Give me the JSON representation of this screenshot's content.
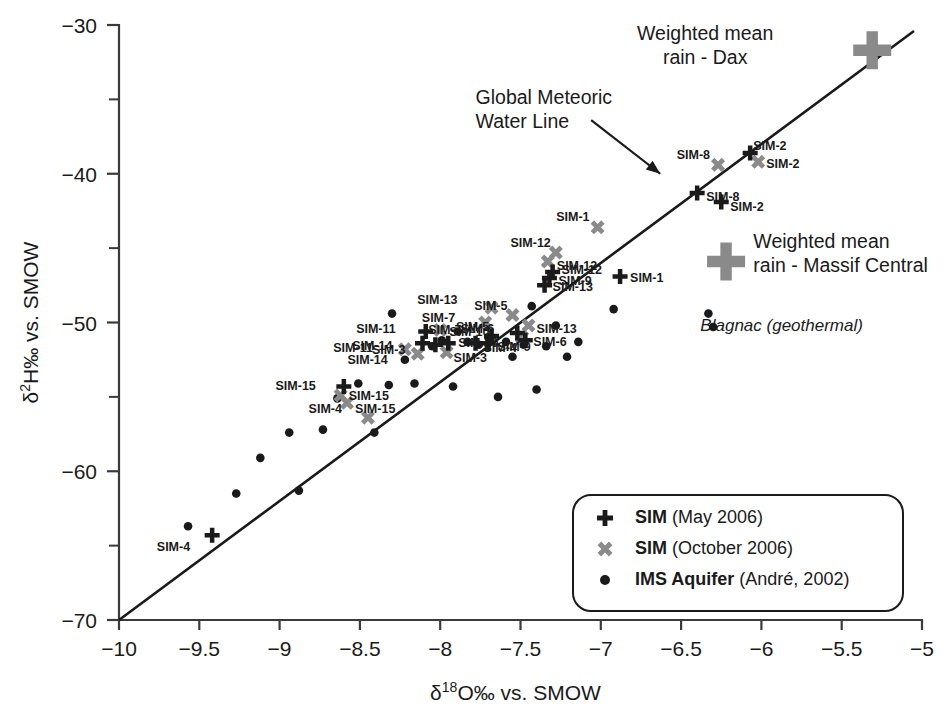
{
  "chart_data": {
    "type": "scatter",
    "title": "",
    "xlabel": "δ¹⁸O‰ vs. SMOW",
    "ylabel": "δ²H‰ vs. SMOW",
    "xlim": [
      -10,
      -5
    ],
    "ylim": [
      -70,
      -30
    ],
    "xticks": [
      "-10",
      "-9.5",
      "-9",
      "-8.5",
      "-8",
      "-7.5",
      "-7",
      "-6.5",
      "-6",
      "-5.5",
      "-5"
    ],
    "xtick_values": [
      -10,
      -9.5,
      -9,
      -8.5,
      -8,
      -7.5,
      -7,
      -6.5,
      -6,
      -5.5,
      -5
    ],
    "yticks": [
      "-30",
      "-40",
      "-50",
      "-60",
      "-70"
    ],
    "ytick_values": [
      -30,
      -40,
      -50,
      -60,
      -70
    ],
    "ytick_minor_values": [
      -35,
      -45,
      -55,
      -65
    ],
    "grid": false,
    "legend_position": "bottom-right",
    "reference_line": {
      "name": "Global Meteoric Water Line",
      "equation_slope": 8,
      "equation_intercept": 10,
      "x_start": -10,
      "y_start": -70,
      "x_end": -5.05,
      "y_end": -30.4,
      "color": "#1a1a1a"
    },
    "series": [
      {
        "name": "SIM (May 2006)",
        "marker": "plus",
        "color": "#1a1a1a",
        "points": [
          {
            "label": "SIM-4",
            "x": -9.42,
            "y": -64.3,
            "lx": -22,
            "ly": 12
          },
          {
            "label": "SIM-15",
            "x": -8.6,
            "y": -54.3,
            "lx": -28,
            "ly": 0
          },
          {
            "label": "SIM-11",
            "x": -8.09,
            "y": -50.6,
            "lx": -30,
            "ly": -2
          },
          {
            "label": "SIM-14",
            "x": -8.11,
            "y": -51.4,
            "lx": -30,
            "ly": 3
          },
          {
            "label": "SIM-3",
            "x": -8.03,
            "y": -51.5,
            "lx": -30,
            "ly": 5
          },
          {
            "label": "SIM-10",
            "x": -7.95,
            "y": -51.4,
            "lx": 10,
            "ly": 0
          },
          {
            "label": "SIM-4",
            "x": -7.78,
            "y": -51.4,
            "lx": 8,
            "ly": 5
          },
          {
            "label": "SIM-9",
            "x": -7.7,
            "y": -51.4,
            "lx": 9,
            "ly": 4
          },
          {
            "label": "SIM-7",
            "x": -7.68,
            "y": -50.9,
            "lx": -30,
            "ly": -6
          },
          {
            "label": "SIM-6",
            "x": -7.47,
            "y": -51.2,
            "lx": 8,
            "ly": 2
          },
          {
            "label": "SIM-5",
            "x": -7.52,
            "y": -50.7,
            "lx": -28,
            "ly": -6
          },
          {
            "label": "SIM-13",
            "x": -7.35,
            "y": -47.5,
            "lx": 8,
            "ly": 2
          },
          {
            "label": "SIM-9",
            "x": -7.32,
            "y": -47.0,
            "lx": 9,
            "ly": 3
          },
          {
            "label": "SIM-12",
            "x": -7.3,
            "y": -46.6,
            "lx": 9,
            "ly": -2
          },
          {
            "label": "SIM-1",
            "x": -6.88,
            "y": -46.9,
            "lx": 10,
            "ly": 2
          },
          {
            "label": "SIM-8",
            "x": -6.4,
            "y": -41.3,
            "lx": 9,
            "ly": 4
          },
          {
            "label": "SIM-2",
            "x": -6.25,
            "y": -41.9,
            "lx": 9,
            "ly": 5
          },
          {
            "label": "SIM-2",
            "x": -6.07,
            "y": -38.6,
            "lx": 3,
            "ly": -7
          }
        ]
      },
      {
        "name": "SIM (October 2006)",
        "marker": "cross",
        "color": "#8a8a8a",
        "points": [
          {
            "label": "SIM-4",
            "x": -8.45,
            "y": -56.4,
            "lx": -26,
            "ly": -9
          },
          {
            "label": "SIM-15",
            "x": -8.62,
            "y": -54.9,
            "lx": 8,
            "ly": 1
          },
          {
            "label": "SIM-15",
            "x": -8.58,
            "y": -55.4,
            "lx": 8,
            "ly": 6
          },
          {
            "label": "SIM-11",
            "x": -8.22,
            "y": -51.8,
            "lx": -32,
            "ly": -1
          },
          {
            "label": "SIM-14",
            "x": -8.14,
            "y": -52.1,
            "lx": -30,
            "ly": 6
          },
          {
            "label": "SIM-3",
            "x": -7.96,
            "y": -52.0,
            "lx": 7,
            "ly": 6
          },
          {
            "label": "SIM-10",
            "x": -8.0,
            "y": -50.5,
            "lx": 9,
            "ly": 2
          },
          {
            "label": "SIM-6",
            "x": -7.49,
            "y": -51.0,
            "lx": -28,
            "ly": -8
          },
          {
            "label": "SIM-7",
            "x": -7.72,
            "y": -50.0,
            "lx": -30,
            "ly": -5
          },
          {
            "label": "SIM-13",
            "x": -7.68,
            "y": -49.0,
            "lx": -34,
            "ly": -8
          },
          {
            "label": "SIM-13",
            "x": -7.45,
            "y": -50.2,
            "lx": 8,
            "ly": 4
          },
          {
            "label": "SIM-5",
            "x": -7.55,
            "y": -49.5,
            "lx": -5,
            "ly": -9
          },
          {
            "label": "SIM-12",
            "x": -7.33,
            "y": -45.9,
            "lx": 9,
            "ly": 4
          },
          {
            "label": "SIM-12",
            "x": -7.28,
            "y": -45.3,
            "lx": -5,
            "ly": -10
          },
          {
            "label": "SIM-1",
            "x": -7.02,
            "y": -43.6,
            "lx": -8,
            "ly": -10
          },
          {
            "label": "SIM-8",
            "x": -6.27,
            "y": -39.4,
            "lx": -8,
            "ly": -10
          },
          {
            "label": "SIM-2",
            "x": -6.02,
            "y": -39.2,
            "lx": 8,
            "ly": 2
          }
        ]
      },
      {
        "name": "IMS Aquifer (André, 2002)",
        "marker": "dot",
        "color": "#1a1a1a",
        "points": [
          {
            "x": -9.57,
            "y": -63.7
          },
          {
            "x": -9.27,
            "y": -61.5
          },
          {
            "x": -9.12,
            "y": -59.1
          },
          {
            "x": -8.94,
            "y": -57.4
          },
          {
            "x": -8.88,
            "y": -61.3
          },
          {
            "x": -8.73,
            "y": -57.2
          },
          {
            "x": -8.64,
            "y": -55.1
          },
          {
            "x": -8.51,
            "y": -54.1
          },
          {
            "x": -8.41,
            "y": -57.4
          },
          {
            "x": -8.32,
            "y": -54.2
          },
          {
            "x": -8.3,
            "y": -49.4
          },
          {
            "x": -8.22,
            "y": -52.5
          },
          {
            "x": -8.16,
            "y": -54.1
          },
          {
            "x": -8.05,
            "y": -51.6
          },
          {
            "x": -7.99,
            "y": -51.2
          },
          {
            "x": -7.92,
            "y": -54.3
          },
          {
            "x": -7.89,
            "y": -50.6
          },
          {
            "x": -7.83,
            "y": -51.3
          },
          {
            "x": -7.76,
            "y": -51.5
          },
          {
            "x": -7.7,
            "y": -51.0
          },
          {
            "x": -7.64,
            "y": -55.0
          },
          {
            "x": -7.59,
            "y": -51.3
          },
          {
            "x": -7.55,
            "y": -52.3
          },
          {
            "x": -7.48,
            "y": -51.5
          },
          {
            "x": -7.43,
            "y": -48.9
          },
          {
            "x": -7.4,
            "y": -54.5
          },
          {
            "x": -7.34,
            "y": -51.6
          },
          {
            "x": -7.28,
            "y": -50.2
          },
          {
            "x": -7.21,
            "y": -52.3
          },
          {
            "x": -7.14,
            "y": -51.3
          },
          {
            "x": -6.92,
            "y": -49.1
          },
          {
            "x": -6.33,
            "y": -49.4
          },
          {
            "x": -6.3,
            "y": -50.3
          }
        ]
      }
    ],
    "special_markers": [
      {
        "name": "Weighted mean rain - Dax",
        "label_lines": [
          "Weighted mean",
          "rain - Dax"
        ],
        "marker": "big-plus",
        "color": "#8a8a8a",
        "x": -5.31,
        "y": -31.7,
        "label_x": -6.35,
        "label_y": -31.0,
        "label_align": "middle"
      },
      {
        "name": "Weighted mean rain - Massif Central",
        "label_lines": [
          "Weighted mean",
          "rain - Massif Central"
        ],
        "marker": "big-plus",
        "color": "#8a8a8a",
        "x": -6.22,
        "y": -45.9,
        "label_x": -6.05,
        "label_y": -45.0,
        "label_align": "start"
      }
    ],
    "annotations": [
      {
        "name": "gmwl-annotation",
        "lines": [
          "Global Meteoric",
          "Water Line"
        ],
        "x": -7.78,
        "y": -35.3,
        "italic": false,
        "arrow": {
          "x1": -7.06,
          "y1": -36.4,
          "x2": -6.63,
          "y2": -40.0
        }
      },
      {
        "name": "blagnac-annotation",
        "lines": [
          "Blagnac (geothermal)"
        ],
        "x": -6.38,
        "y": -50.6,
        "italic": true,
        "arrow": null
      }
    ],
    "legend": {
      "entries": [
        {
          "marker": "plus",
          "color": "#1a1a1a",
          "bold": "SIM",
          "rest": " (May 2006)"
        },
        {
          "marker": "cross",
          "color": "#8a8a8a",
          "bold": "SIM",
          "rest": " (October 2006)"
        },
        {
          "marker": "dot",
          "color": "#1a1a1a",
          "bold": "IMS Aquifer",
          "rest": " (André, 2002)"
        }
      ]
    }
  }
}
